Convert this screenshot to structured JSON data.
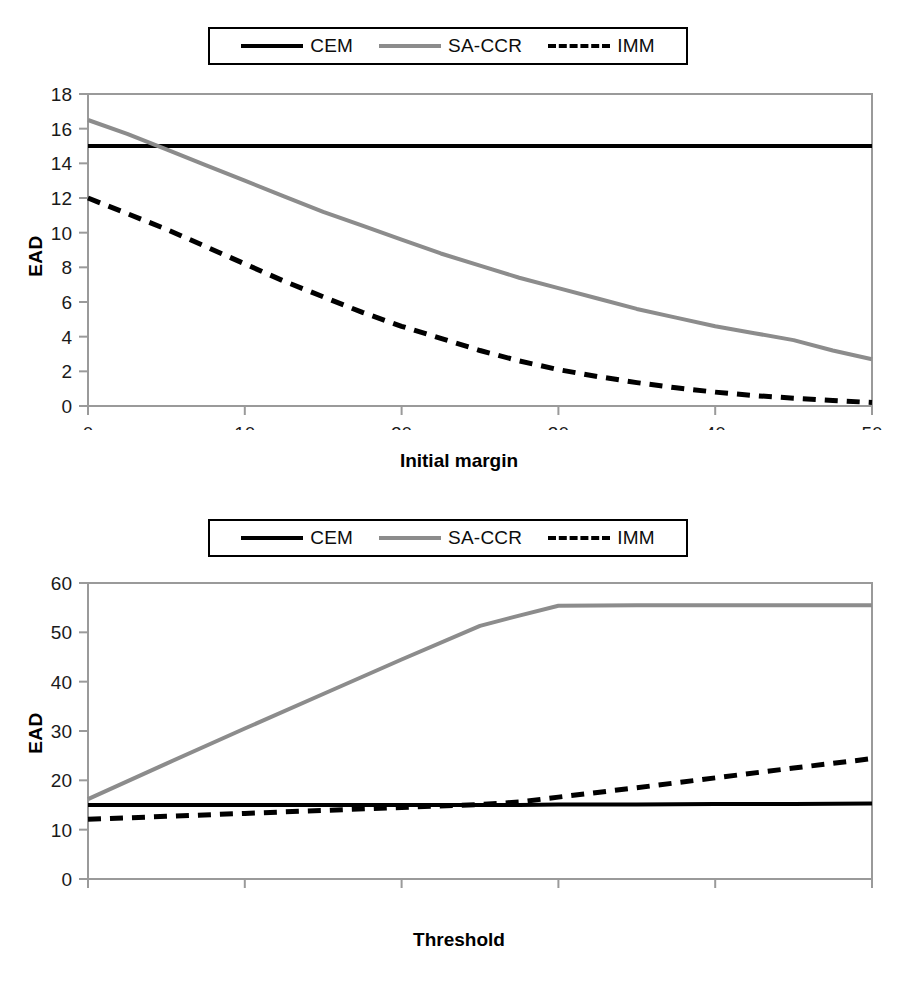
{
  "figures": [
    {
      "id": "initial-margin",
      "legend": {
        "entries": [
          {
            "label": "CEM",
            "style": "solid",
            "color": "#000000"
          },
          {
            "label": "SA-CCR",
            "style": "solid",
            "color": "#8c8c8c"
          },
          {
            "label": "IMM",
            "style": "dashed",
            "color": "#000000"
          }
        ]
      },
      "chart_data": {
        "type": "line",
        "title": "",
        "xlabel": "Initial margin",
        "ylabel": "EAD",
        "xlim": [
          0,
          50
        ],
        "ylim": [
          0,
          18
        ],
        "xticks": [
          0,
          10,
          20,
          30,
          40,
          50
        ],
        "yticks": [
          0,
          2,
          4,
          6,
          8,
          10,
          12,
          14,
          16,
          18
        ],
        "grid": false,
        "legend_position": "above-plot",
        "x": [
          0,
          2.5,
          5,
          7.5,
          10,
          12.5,
          15,
          17.5,
          20,
          22.5,
          25,
          27.5,
          30,
          32.5,
          35,
          37.5,
          40,
          42.5,
          45,
          47.5,
          50
        ],
        "series": [
          {
            "name": "CEM",
            "style": "solid",
            "color": "#000000",
            "values": [
              15.0,
              15.0,
              15.0,
              15.0,
              15.0,
              15.0,
              15.0,
              15.0,
              15.0,
              15.0,
              15.0,
              15.0,
              15.0,
              15.0,
              15.0,
              15.0,
              15.0,
              15.0,
              15.0,
              15.0,
              15.0
            ]
          },
          {
            "name": "SA-CCR",
            "style": "solid",
            "color": "#8c8c8c",
            "values": [
              16.5,
              15.7,
              14.8,
              13.9,
              13.0,
              12.1,
              11.2,
              10.4,
              9.6,
              8.8,
              8.1,
              7.4,
              6.8,
              6.2,
              5.6,
              5.1,
              4.6,
              4.2,
              3.8,
              3.2,
              2.7
            ]
          },
          {
            "name": "IMM",
            "style": "dashed",
            "color": "#000000",
            "values": [
              12.0,
              11.1,
              10.2,
              9.2,
              8.2,
              7.2,
              6.3,
              5.4,
              4.6,
              3.9,
              3.2,
              2.6,
              2.1,
              1.7,
              1.35,
              1.05,
              0.8,
              0.6,
              0.45,
              0.32,
              0.2
            ]
          }
        ]
      }
    },
    {
      "id": "threshold",
      "legend": {
        "entries": [
          {
            "label": "CEM",
            "style": "solid",
            "color": "#000000"
          },
          {
            "label": "SA-CCR",
            "style": "solid",
            "color": "#8c8c8c"
          },
          {
            "label": "IMM",
            "style": "dashed",
            "color": "#000000"
          }
        ]
      },
      "chart_data": {
        "type": "line",
        "title": "",
        "xlabel": "Threshold",
        "ylabel": "EAD",
        "xlim": [
          0,
          50
        ],
        "ylim": [
          0,
          60
        ],
        "xticks": [
          0,
          10,
          20,
          30,
          40,
          50
        ],
        "yticks": [
          0,
          10,
          20,
          30,
          40,
          50,
          60
        ],
        "grid": false,
        "legend_position": "above-plot",
        "x": [
          0,
          5,
          10,
          15,
          20,
          25,
          27.5,
          30,
          35,
          40,
          45,
          50
        ],
        "series": [
          {
            "name": "CEM",
            "style": "solid",
            "color": "#000000",
            "values": [
              15.0,
              15.0,
              15.0,
              15.0,
              15.0,
              15.0,
              15.0,
              15.1,
              15.1,
              15.2,
              15.2,
              15.3
            ]
          },
          {
            "name": "SA-CCR",
            "style": "solid",
            "color": "#8c8c8c",
            "values": [
              16.2,
              23.4,
              30.5,
              37.5,
              44.5,
              51.3,
              53.4,
              55.4,
              55.5,
              55.5,
              55.5,
              55.5
            ]
          },
          {
            "name": "IMM",
            "style": "dashed",
            "color": "#000000",
            "values": [
              12.1,
              12.7,
              13.3,
              13.9,
              14.5,
              15.1,
              15.6,
              16.6,
              18.5,
              20.5,
              22.5,
              24.4
            ]
          }
        ]
      }
    }
  ]
}
